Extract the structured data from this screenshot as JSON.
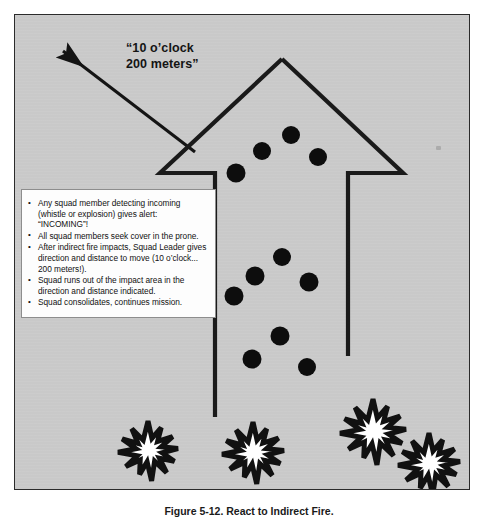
{
  "figure": {
    "caption": "Figure 5-12. React to Indirect Fire.",
    "frame_fill": "#c9c9c9",
    "frame_border": "#2b2b2b"
  },
  "direction_callout": {
    "icon": "arrow-up-left-icon",
    "text": "“10 o’clock\n200 meters”",
    "line_1": "“10 o’clock",
    "line_2": "200 meters”"
  },
  "movement_arrow": {
    "name": "large-movement-arrow",
    "outline_color": "#1a1a1a",
    "fill": "none",
    "description": "Large open up-pointing arrow outline indicating squad movement out of the impact area"
  },
  "squad_members": {
    "marker_color": "#0d0d0d",
    "marker_icon": "soldier-dot-icon",
    "count": 11,
    "positions": [
      {
        "x": 276,
        "y": 120,
        "r": 9
      },
      {
        "x": 247,
        "y": 136,
        "r": 9
      },
      {
        "x": 303,
        "y": 142,
        "r": 9
      },
      {
        "x": 221,
        "y": 158,
        "r": 9.5
      },
      {
        "x": 267,
        "y": 242,
        "r": 9
      },
      {
        "x": 240,
        "y": 261,
        "r": 9.5
      },
      {
        "x": 294,
        "y": 267,
        "r": 9.5
      },
      {
        "x": 219,
        "y": 281,
        "r": 9.5
      },
      {
        "x": 265,
        "y": 321,
        "r": 9.5
      },
      {
        "x": 237,
        "y": 344,
        "r": 9.5
      },
      {
        "x": 292,
        "y": 352,
        "r": 9
      }
    ]
  },
  "impact_bursts": {
    "name": "indirect-fire-impact-burst",
    "icon": "explosion-burst-icon",
    "fill": "#ffffff",
    "outline": "#111111",
    "count": 4,
    "positions": [
      {
        "x": 133,
        "y": 436,
        "r": 30
      },
      {
        "x": 238,
        "y": 438,
        "r": 31
      },
      {
        "x": 358,
        "y": 417,
        "r": 33
      },
      {
        "x": 414,
        "y": 449,
        "r": 31
      }
    ]
  },
  "instructions": {
    "box_bg": "#fdfdfd",
    "box_border": "#8d8d8d",
    "items": [
      "Any squad member detecting incoming (whistle or explosion) gives alert: “INCOMING”!",
      "All squad members seek cover in the prone.",
      "After indirect fire impacts, Squad Leader gives direction and distance to move (10 o’clock... 200 meters!).",
      "Squad runs out of the impact area in the direction and distance indicated.",
      "Squad consolidates, continues mission."
    ]
  }
}
